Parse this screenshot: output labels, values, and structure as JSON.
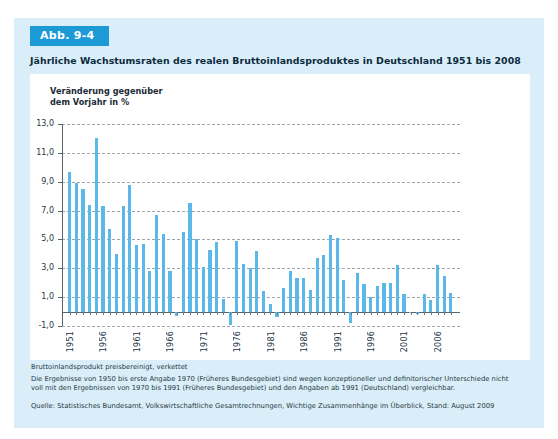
{
  "figure": {
    "badge": "Abb. 9-4",
    "title": "Jährliche Wachstumsraten des realen Bruttoinlandsproduktes in Deutschland 1951 bis 2008",
    "axis_caption_line1": "Veränderung gegenüber",
    "axis_caption_line2": "dem Vorjahr in %",
    "note_line1": "Bruttoinlandsprodukt preisbereinigt, verkettet",
    "note_line2": "Die Ergebnisse von 1950 bis erste Angabe 1970 (Früheres Bundesgebiet) sind wegen konzeptioneller und definitorischer Unterschiede nicht",
    "note_line3": "voll mit den Ergebnissen von 1970 bis 1991 (Früheres Bundesgebiet) und den Angaben ab 1991 (Deutschland) vergleichbar.",
    "source": "Quelle: Statistisches Bundesamt, Volkswirtschaftliche Gesamtrechnungen, Wichtige Zusammenhänge im Überblick, Stand: August 2009",
    "colors": {
      "badge_bg": "#1b9ad6",
      "page_bg": "#d9eef8",
      "bar": "#5bb8e8",
      "card_bg": "#ffffff",
      "title_text": "#0d2b3e"
    }
  },
  "chart_data": {
    "type": "bar",
    "title": "Jährliche Wachstumsraten des realen Bruttoinlandsproduktes in Deutschland 1951 bis 2008",
    "xlabel": "",
    "ylabel": "Veränderung gegenüber dem Vorjahr in %",
    "ylim": [
      -1.0,
      13.0
    ],
    "yticks": [
      -1.0,
      1.0,
      3.0,
      5.0,
      7.0,
      9.0,
      11.0,
      13.0
    ],
    "ytick_labels": [
      "-1,0",
      "1,0",
      "3,0",
      "5,0",
      "7,0",
      "9,0",
      "11,0",
      "13,0"
    ],
    "xtick_labels": [
      "1951",
      "1956",
      "1961",
      "1966",
      "1971",
      "1976",
      "1981",
      "1986",
      "1991",
      "1996",
      "2001",
      "2006"
    ],
    "grid": true,
    "legend": false,
    "categories": [
      1951,
      1952,
      1953,
      1954,
      1955,
      1956,
      1957,
      1958,
      1959,
      1960,
      1961,
      1962,
      1963,
      1964,
      1965,
      1966,
      1967,
      1968,
      1969,
      1970,
      1971,
      1972,
      1973,
      1974,
      1975,
      1976,
      1977,
      1978,
      1979,
      1980,
      1981,
      1982,
      1983,
      1984,
      1985,
      1986,
      1987,
      1988,
      1989,
      1990,
      1991,
      1992,
      1993,
      1994,
      1995,
      1996,
      1997,
      1998,
      1999,
      2000,
      2001,
      2002,
      2003,
      2004,
      2005,
      2006,
      2007,
      2008
    ],
    "values": [
      9.7,
      8.9,
      8.5,
      7.4,
      12.0,
      7.3,
      5.7,
      4.0,
      7.3,
      8.8,
      4.6,
      4.7,
      2.8,
      6.7,
      5.4,
      2.8,
      -0.3,
      5.5,
      7.5,
      5.0,
      3.1,
      4.3,
      4.8,
      0.9,
      -0.9,
      4.9,
      3.3,
      3.0,
      4.2,
      1.4,
      0.5,
      -0.4,
      1.6,
      2.8,
      2.3,
      2.3,
      1.5,
      3.7,
      3.9,
      5.3,
      5.1,
      2.2,
      -0.8,
      2.7,
      1.9,
      1.0,
      1.8,
      2.0,
      2.0,
      3.2,
      1.2,
      0.0,
      -0.2,
      1.2,
      0.8,
      3.2,
      2.5,
      1.3
    ]
  }
}
